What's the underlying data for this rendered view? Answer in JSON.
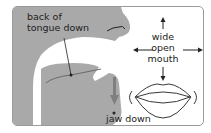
{
  "diagram": {
    "labels": {
      "tongue_line1": "back of",
      "tongue_line2": "tongue down",
      "jaw": "jaw down",
      "mouth_line1": "wide",
      "mouth_line2": "open",
      "mouth_line3": "mouth"
    },
    "colors": {
      "head_fill": "#a9a9a9",
      "arrow_fill": "#7f7f7f",
      "line": "#222222",
      "border": "#9a9a9a"
    }
  }
}
